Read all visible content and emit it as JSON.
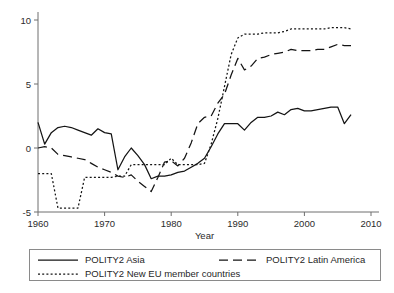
{
  "figure": {
    "kind": "line-chart",
    "background": "#ffffff",
    "line_color": "#141414",
    "axis_color": "#6e6e6e",
    "legend_border": "#8a8a8a"
  },
  "axes": {
    "x_title": "Year",
    "y_title": "",
    "x_ticks": [
      "1960",
      "1970",
      "1980",
      "1990",
      "2000",
      "2010"
    ],
    "y_ticks": [
      "-5",
      "0",
      "5",
      "10"
    ]
  },
  "legend": {
    "entries": [
      {
        "label": "POLITY2 Asia",
        "style": "solid",
        "dash": "none"
      },
      {
        "label": "POLITY2 Latin America",
        "style": "dashed",
        "dash": "9,5"
      },
      {
        "label": "POLITY2 New EU member countries",
        "style": "dotted",
        "dash": "2,2.2"
      }
    ]
  },
  "chart_data": {
    "type": "line",
    "title": "",
    "subtitle": "",
    "xlabel": "Year",
    "ylabel": "",
    "xlim": [
      1960,
      2010
    ],
    "ylim": [
      -5,
      10
    ],
    "x_ticks": [
      1960,
      1970,
      1980,
      1990,
      2000,
      2010
    ],
    "y_ticks": [
      -5,
      0,
      5,
      10
    ],
    "grid": false,
    "legend_position": "bottom",
    "x": [
      1960,
      1961,
      1962,
      1963,
      1964,
      1965,
      1966,
      1967,
      1968,
      1969,
      1970,
      1971,
      1972,
      1973,
      1974,
      1975,
      1976,
      1977,
      1978,
      1979,
      1980,
      1981,
      1982,
      1983,
      1984,
      1985,
      1986,
      1987,
      1988,
      1989,
      1990,
      1991,
      1992,
      1993,
      1994,
      1995,
      1996,
      1997,
      1998,
      1999,
      2000,
      2001,
      2002,
      2003,
      2004,
      2005,
      2006,
      2007
    ],
    "series": [
      {
        "name": "POLITY2 Asia",
        "style": "solid",
        "values": [
          2.0,
          0.3,
          1.2,
          1.6,
          1.7,
          1.6,
          1.4,
          1.2,
          1.0,
          1.5,
          1.2,
          1.1,
          -1.7,
          -0.7,
          0.0,
          -0.6,
          -1.3,
          -2.4,
          -2.2,
          -2.2,
          -2.1,
          -1.9,
          -1.8,
          -1.5,
          -1.2,
          -0.8,
          0.1,
          1.1,
          1.9,
          1.9,
          1.9,
          1.4,
          2.0,
          2.4,
          2.4,
          2.5,
          2.8,
          2.6,
          3.0,
          3.1,
          2.9,
          2.9,
          3.0,
          3.1,
          3.2,
          3.2,
          1.9,
          2.6
        ]
      },
      {
        "name": "POLITY2 Latin America",
        "style": "dashed",
        "values": [
          0.0,
          0.1,
          0.0,
          -0.5,
          -0.6,
          -0.7,
          -0.8,
          -0.9,
          -1.2,
          -1.5,
          -1.7,
          -1.9,
          -2.2,
          -2.3,
          -2.1,
          -2.6,
          -3.0,
          -3.4,
          -2.3,
          -1.1,
          -1.0,
          -1.4,
          -0.8,
          0.4,
          1.9,
          2.4,
          2.5,
          3.5,
          4.2,
          5.7,
          7.0,
          6.1,
          6.4,
          7.0,
          7.1,
          7.3,
          7.4,
          7.5,
          7.7,
          7.6,
          7.6,
          7.6,
          7.7,
          7.7,
          7.9,
          8.1,
          8.0,
          8.0
        ]
      },
      {
        "name": "POLITY2 New EU member countries",
        "style": "dotted",
        "values": [
          -2.0,
          -2.0,
          -2.0,
          -4.7,
          -4.7,
          -4.7,
          -4.7,
          -2.3,
          -2.3,
          -2.3,
          -2.3,
          -2.3,
          -2.2,
          -2.2,
          -1.3,
          -1.3,
          -1.3,
          -1.3,
          -1.3,
          -1.3,
          -0.8,
          -1.3,
          -1.3,
          -1.3,
          -1.3,
          -1.2,
          0.3,
          2.3,
          4.8,
          7.3,
          8.6,
          8.9,
          8.9,
          8.9,
          9.0,
          9.0,
          9.0,
          9.1,
          9.3,
          9.3,
          9.3,
          9.3,
          9.3,
          9.3,
          9.4,
          9.4,
          9.4,
          9.3
        ]
      }
    ]
  }
}
